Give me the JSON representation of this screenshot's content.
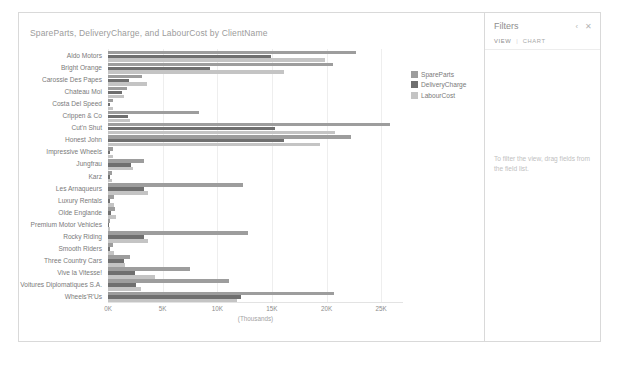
{
  "chart": {
    "title": "SpareParts, DeliveryCharge, and LabourCost by ClientName",
    "xaxis_title": "(Thousands)"
  },
  "legend": {
    "items": [
      {
        "label": "SpareParts",
        "color": "#9d9d9d"
      },
      {
        "label": "DeliveryCharge",
        "color": "#6f6f6f"
      },
      {
        "label": "LabourCost",
        "color": "#c4c4c4"
      }
    ]
  },
  "filters": {
    "title": "Filters",
    "tabs": [
      {
        "label": "VIEW",
        "active": true
      },
      {
        "label": "CHART",
        "active": false
      }
    ],
    "separator": "|",
    "collapse_icon": "‹",
    "close_icon": "✕",
    "empty_text": "To filter the view, drag fields from the field list."
  },
  "chart_data": {
    "type": "bar",
    "orientation": "horizontal",
    "title": "SpareParts, DeliveryCharge, and LabourCost by ClientName",
    "xlabel": "(Thousands)",
    "ylabel": "",
    "xlim": [
      0,
      27000
    ],
    "xticks": [
      0,
      5000,
      10000,
      15000,
      20000,
      25000
    ],
    "xticklabels": [
      "0K",
      "5K",
      "10K",
      "15K",
      "20K",
      "25K"
    ],
    "grid": true,
    "legend_position": "right",
    "categories": [
      "Aldo Motors",
      "Bright Orange",
      "Carossie Des Papes",
      "Chateau Moi",
      "Costa Del Speed",
      "Crippen & Co",
      "Cut'n Shut",
      "Honest John",
      "Impressive Wheels",
      "Jungfrau",
      "Karz",
      "Les Arnaqueurs",
      "Luxury Rentals",
      "Olde Englande",
      "Premium Motor Vehicles",
      "Rocky Riding",
      "Smooth Riders",
      "Three Country Cars",
      "Vive la Vitesse!",
      "Voitures Diplomatiques S.A.",
      "Wheels'R'Us"
    ],
    "series": [
      {
        "name": "SpareParts",
        "color": "#9d9d9d",
        "values": [
          22700,
          20600,
          3100,
          1700,
          420,
          8300,
          25800,
          22200,
          420,
          3300,
          330,
          12400,
          560,
          660,
          140,
          12800,
          500,
          2000,
          7500,
          11100,
          20700
        ]
      },
      {
        "name": "DeliveryCharge",
        "color": "#6f6f6f",
        "values": [
          14900,
          9300,
          1900,
          1300,
          180,
          1800,
          15300,
          16100,
          180,
          2100,
          140,
          3300,
          210,
          280,
          60,
          3300,
          200,
          1500,
          2500,
          2600,
          12200
        ]
      },
      {
        "name": "LabourCost",
        "color": "#c4c4c4",
        "values": [
          19900,
          16100,
          3600,
          1500,
          430,
          2000,
          20800,
          19400,
          430,
          2300,
          350,
          3700,
          560,
          700,
          150,
          3700,
          520,
          1600,
          4300,
          3000,
          11800
        ]
      }
    ]
  }
}
